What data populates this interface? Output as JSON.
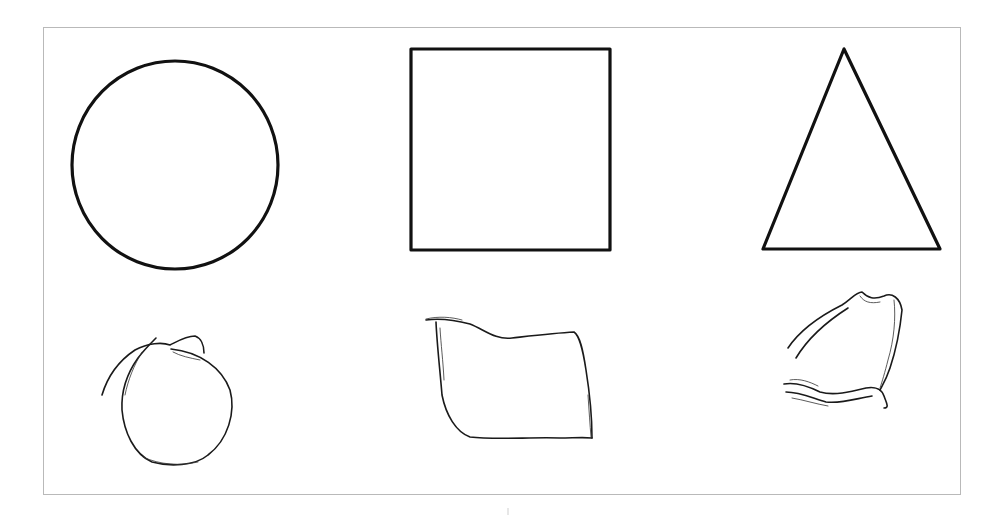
{
  "figure": {
    "frame": {
      "x": 43,
      "y": 27,
      "width": 917,
      "height": 467,
      "color": "#b9b9b9"
    },
    "stroke_color": "#111111",
    "rows": [
      {
        "name": "reference-row",
        "shapes": [
          {
            "kind": "circle",
            "cx": 175,
            "cy": 165,
            "r": 103
          },
          {
            "kind": "square",
            "x": 410,
            "y": 48,
            "width": 200,
            "height": 202
          },
          {
            "kind": "triangle",
            "points": [
              [
                844,
                48
              ],
              [
                763,
                250
              ],
              [
                941,
                249
              ]
            ]
          }
        ]
      },
      {
        "name": "sketch-row",
        "shapes": [
          {
            "kind": "sketched-circle"
          },
          {
            "kind": "sketched-square"
          },
          {
            "kind": "sketched-triangle"
          }
        ]
      }
    ]
  }
}
